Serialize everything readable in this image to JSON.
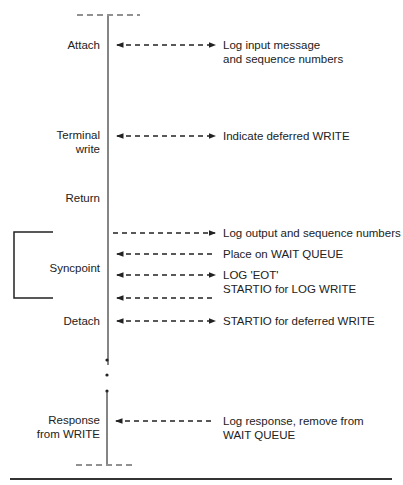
{
  "diagram": {
    "timeline_events": [
      {
        "id": "attach",
        "label": [
          "Attach"
        ]
      },
      {
        "id": "terminal-write",
        "label": [
          "Terminal",
          "write"
        ]
      },
      {
        "id": "return",
        "label": [
          "Return"
        ]
      },
      {
        "id": "syncpoint",
        "label": [
          "Syncpoint"
        ]
      },
      {
        "id": "detach",
        "label": [
          "Detach"
        ]
      },
      {
        "id": "response-from-write",
        "label": [
          "Response",
          "from WRITE"
        ]
      }
    ],
    "actions": [
      {
        "id": "log-input",
        "direction": "both",
        "text": [
          "Log input message",
          "and sequence numbers"
        ]
      },
      {
        "id": "indicate-deferred",
        "direction": "both",
        "text": [
          "Indicate deferred WRITE"
        ]
      },
      {
        "id": "log-output",
        "direction": "right",
        "text": [
          "Log output and sequence numbers"
        ]
      },
      {
        "id": "place-wait-queue",
        "direction": "left",
        "text": [
          "Place on WAIT QUEUE"
        ]
      },
      {
        "id": "log-eot",
        "direction": "both",
        "text": [
          "LOG 'EOT'",
          "STARTIO for LOG WRITE"
        ]
      },
      {
        "id": "log-eot-return",
        "direction": "left",
        "text": []
      },
      {
        "id": "startio-deferred",
        "direction": "both",
        "text": [
          "STARTIO for deferred WRITE"
        ]
      },
      {
        "id": "log-response",
        "direction": "left",
        "text": [
          "Log response, remove from",
          "WAIT QUEUE"
        ]
      }
    ],
    "colors": {
      "ink": "#222222",
      "background": "#ffffff"
    }
  }
}
